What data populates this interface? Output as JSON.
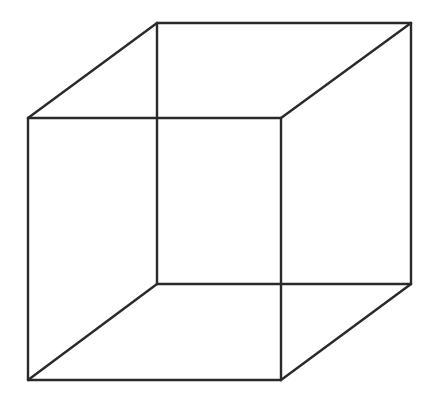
{
  "figure": {
    "line_color": "#2a2a2a",
    "background_color": "#ffffff",
    "edge_count": 12,
    "vertex_count": 8
  }
}
